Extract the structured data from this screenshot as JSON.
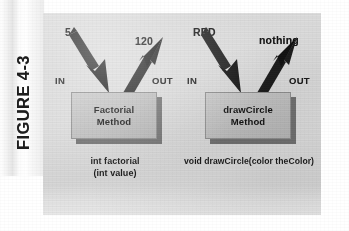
{
  "figure": {
    "label": "FIGURE 4-3",
    "caption_orientation": "vertical-left"
  },
  "panel": {
    "background_color": "#d9d9d9",
    "box_fill_color": "#bdbdbd",
    "box_shadow_color": "#6f6f6f",
    "arrow_color": "#1a1a1a",
    "text_color": "#111111"
  },
  "diagrams": [
    {
      "id": "factorial",
      "input_value": "5",
      "output_value": "120",
      "in_label": "IN",
      "out_label": "OUT",
      "box_line1": "Factorial",
      "box_line2": "Method",
      "signature_line1": "int factorial",
      "signature_line2": "(int value)",
      "in_arrow": "arrow-down-right-icon",
      "out_arrow": "arrow-up-right-icon"
    },
    {
      "id": "drawcircle",
      "input_value": "RED",
      "output_value": "nothing",
      "in_label": "IN",
      "out_label": "OUT",
      "box_line1": "drawCircle",
      "box_line2": "Method",
      "signature_line1": "void drawCircle(color theColor)",
      "signature_line2": "",
      "in_arrow": "arrow-down-right-icon",
      "out_arrow": "arrow-up-right-icon"
    }
  ]
}
